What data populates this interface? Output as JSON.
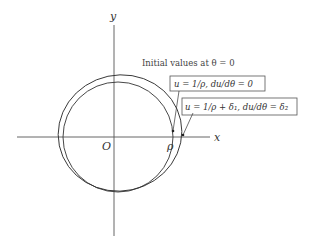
{
  "figure": {
    "axes": {
      "x_label": "x",
      "y_label": "y",
      "origin_label": "O",
      "point_label": "ρ"
    },
    "caption": "Initial values at θ = 0",
    "annotations": [
      {
        "id": "unperturbed",
        "text": "u = 1/ρ,  du/dθ = 0"
      },
      {
        "id": "perturbed",
        "text": "u = 1/ρ + δ₁,  du/dθ = δ₂"
      }
    ],
    "curves": [
      {
        "name": "circular-orbit",
        "type": "circle"
      },
      {
        "name": "perturbed-orbit",
        "type": "ellipse"
      }
    ],
    "colors": {
      "line": "#333333",
      "axis": "#555555",
      "background": "#ffffff"
    }
  }
}
